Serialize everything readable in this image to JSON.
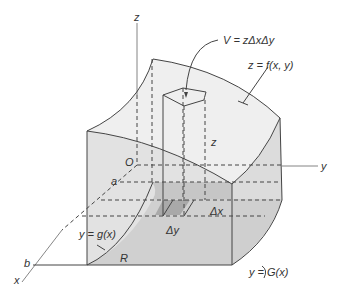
{
  "diagram": {
    "labels": {
      "z_axis": "z",
      "y_axis": "y",
      "x_axis": "x",
      "origin": "O",
      "a": "a",
      "b": "b",
      "volume_formula": "V = zΔxΔy",
      "surface": "z = f(x, y)",
      "column_height": "z",
      "delta_x": "Δx",
      "delta_y": "Δy",
      "lower_bound": "y = g(x)",
      "upper_bound": "y = G(x)",
      "region": "R"
    },
    "colors": {
      "top_surface": "#eeeeee",
      "side_face": "#e2e2e2",
      "region_dark": "#c8c8c8",
      "base_strip": "#d6d6d6",
      "column_base": "#a8a8a8",
      "line": "#444444"
    }
  }
}
